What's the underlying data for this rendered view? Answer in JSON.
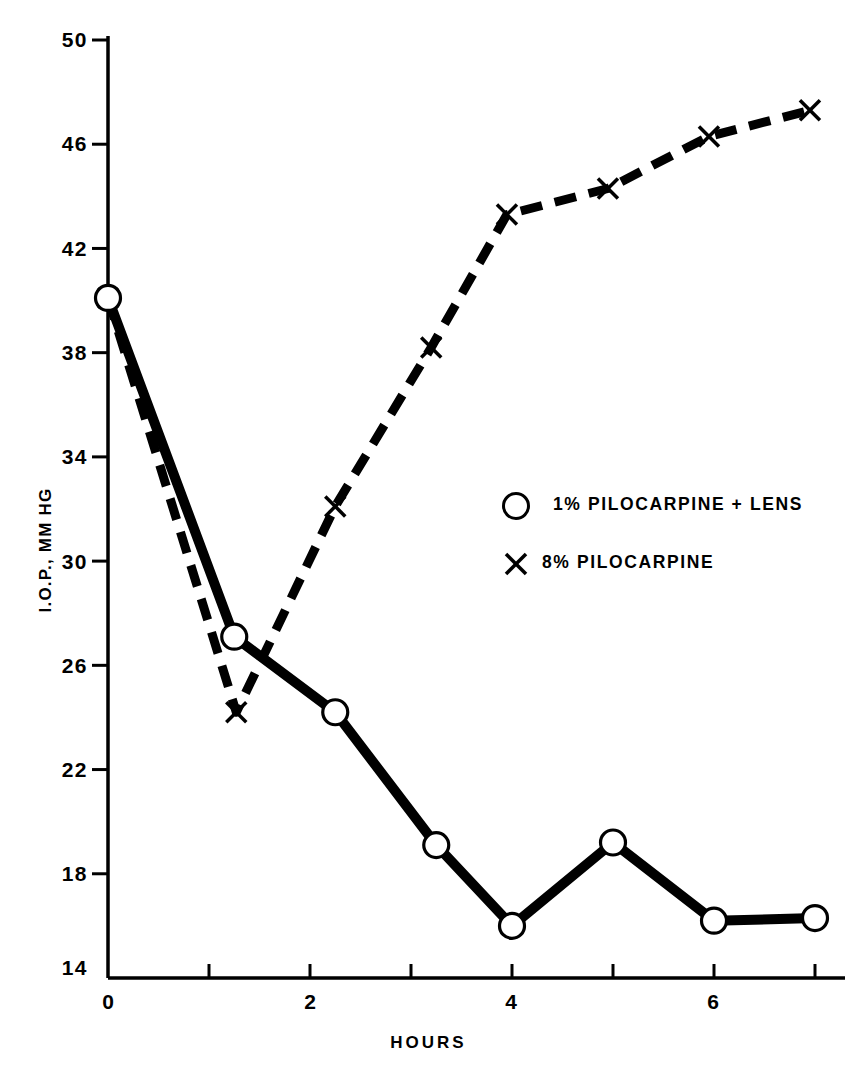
{
  "chart_data": {
    "type": "line",
    "title": "",
    "xlabel": "HOURS",
    "ylabel": "I.O.P., MM HG",
    "xlim": [
      0,
      7.3
    ],
    "ylim": [
      14,
      50
    ],
    "xticks": [
      0,
      1,
      2,
      3,
      4,
      5,
      6,
      7
    ],
    "xtick_labels": [
      "0",
      "",
      "2",
      "",
      "4",
      "",
      "6",
      ""
    ],
    "yticks": [
      14,
      18,
      22,
      26,
      30,
      34,
      38,
      42,
      46,
      50
    ],
    "ytick_labels": [
      "14",
      "18",
      "22",
      "26",
      "30",
      "34",
      "38",
      "42",
      "46",
      "50"
    ],
    "grid": false,
    "legend_position": "center-right",
    "series": [
      {
        "name": "1% PILOCARPINE + LENS",
        "marker": "circle",
        "linestyle": "solid",
        "color": "#000000",
        "x": [
          0,
          1.25,
          2.25,
          3.25,
          4.0,
          5.0,
          6.0,
          7.0
        ],
        "y": [
          40.1,
          27.1,
          24.2,
          19.1,
          16.0,
          19.2,
          16.2,
          16.3
        ]
      },
      {
        "name": "8% PILOCARPINE",
        "marker": "x",
        "linestyle": "dashed",
        "color": "#000000",
        "x": [
          0,
          1.27,
          2.25,
          3.2,
          3.95,
          4.95,
          5.95,
          6.95
        ],
        "y": [
          40.1,
          24.2,
          32.1,
          38.2,
          43.3,
          44.3,
          46.3,
          47.3
        ]
      }
    ]
  },
  "axes": {
    "ytick_labels": [
      "50",
      "46",
      "42",
      "38",
      "34",
      "30",
      "26",
      "22",
      "18",
      "14"
    ],
    "xtick_labels": [
      "0",
      "2",
      "4",
      "6"
    ],
    "x_axis_title": "HOURS",
    "y_axis_title": "I.O.P., MM HG"
  },
  "legend": {
    "items": [
      {
        "marker": "circle",
        "label": "1% PILOCARPINE + LENS"
      },
      {
        "marker": "x",
        "label": "8% PILOCARPINE"
      }
    ]
  },
  "colors": {
    "ink": "#000000",
    "background": "#ffffff"
  }
}
